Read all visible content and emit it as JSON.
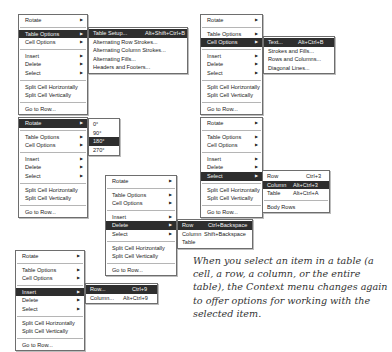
{
  "menus": {
    "m1": {
      "items": [
        "Rotate",
        "Table Options",
        "Cell Options",
        "Insert",
        "Delete",
        "Select",
        "Split Cell Horizontally",
        "Split Cell Vertically",
        "Go to Row..."
      ],
      "highlighted": "Table Options",
      "submenu": {
        "items": [
          {
            "label": "Table Setup...",
            "shortcut": "Alt+Shift+Ctrl+B"
          },
          {
            "label": "Alternating Row Strokes...",
            "shortcut": ""
          },
          {
            "label": "Alternating Column Strokes...",
            "shortcut": ""
          },
          {
            "label": "Alternating Fills...",
            "shortcut": ""
          },
          {
            "label": "Headers and Footers...",
            "shortcut": ""
          }
        ],
        "highlighted": "Table Setup..."
      }
    },
    "m2": {
      "items": [
        "Rotate",
        "Table Options",
        "Cell Options",
        "Insert",
        "Delete",
        "Select",
        "Split Cell Horizontally",
        "Split Cell Vertically",
        "Go to Row..."
      ],
      "highlighted": "Cell Options",
      "submenu": {
        "items": [
          {
            "label": "Text...",
            "shortcut": "Alt+Ctrl+B"
          },
          {
            "label": "Strokes and Fills...",
            "shortcut": ""
          },
          {
            "label": "Rows and Columns...",
            "shortcut": ""
          },
          {
            "label": "Diagonal Lines...",
            "shortcut": ""
          }
        ],
        "highlighted": "Text..."
      }
    },
    "m3": {
      "items": [
        "Rotate",
        "Table Options",
        "Cell Options",
        "Insert",
        "Delete",
        "Select",
        "Split Cell Horizontally",
        "Split Cell Vertically",
        "Go to Row..."
      ],
      "highlighted": "Rotate",
      "submenu": {
        "items": [
          {
            "label": "0°",
            "shortcut": ""
          },
          {
            "label": "90°",
            "shortcut": ""
          },
          {
            "label": "180°",
            "shortcut": ""
          },
          {
            "label": "270°",
            "shortcut": ""
          }
        ],
        "highlighted": "180°"
      }
    },
    "m4": {
      "items": [
        "Rotate",
        "Table Options",
        "Cell Options",
        "Insert",
        "Delete",
        "Select",
        "Split Cell Horizontally",
        "Split Cell Vertically",
        "Go to Row..."
      ],
      "highlighted": "Select",
      "submenu": {
        "items": [
          {
            "label": "Row",
            "shortcut": "Ctrl+3"
          },
          {
            "label": "Column",
            "shortcut": "Alt+Ctrl+3"
          },
          {
            "label": "Table",
            "shortcut": "Alt+Ctrl+A"
          },
          {
            "label": "Body Rows",
            "shortcut": ""
          }
        ],
        "highlighted": "Column"
      }
    },
    "m5": {
      "items": [
        "Rotate",
        "Table Options",
        "Cell Options",
        "Insert",
        "Delete",
        "Select",
        "Split Cell Horizontally",
        "Split Cell Vertically",
        "Go to Row..."
      ],
      "highlighted": "Delete",
      "submenu": {
        "items": [
          {
            "label": "Row",
            "shortcut": "Ctrl+Backspace"
          },
          {
            "label": "Column",
            "shortcut": "Shift+Backspace"
          },
          {
            "label": "Table",
            "shortcut": ""
          }
        ],
        "highlighted": "Row"
      }
    },
    "m6": {
      "items": [
        "Rotate",
        "Table Options",
        "Cell Options",
        "Insert",
        "Delete",
        "Select",
        "Split Cell Horizontally",
        "Split Cell Vertically",
        "Go to Row..."
      ],
      "highlighted": "Insert",
      "submenu": {
        "items": [
          {
            "label": "Row...",
            "shortcut": "Ctrl+9"
          },
          {
            "label": "Column...",
            "shortcut": "Alt+Ctrl+9"
          }
        ],
        "highlighted": "Row..."
      }
    }
  },
  "caption": "When you select an item in a table (a cell, a row, a column, or the entire table), the Context menu changes again to offer options for working with the selected item.",
  "colors": {
    "highlight_bg": "#2e2e2e",
    "highlight_fg": "#f4f4f4",
    "border": "#6e6e6e"
  },
  "icons": {
    "submenu_arrow": "triangle-right-icon"
  }
}
